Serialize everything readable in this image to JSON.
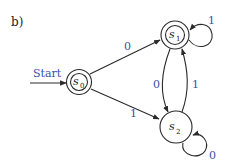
{
  "panel_label": "b)",
  "start_label": "Start",
  "colors": {
    "stroke": "#2a2a2a",
    "label_blue": "#3a4fa8",
    "text": "#1a1a1a",
    "background": "#ffffff"
  },
  "states": [
    {
      "id": "s0",
      "name": "s",
      "subscript": "0",
      "accepting": true,
      "initial": true
    },
    {
      "id": "s1",
      "name": "s",
      "subscript": "1",
      "accepting": true,
      "initial": false
    },
    {
      "id": "s2",
      "name": "s",
      "subscript": "2",
      "accepting": false,
      "initial": false
    }
  ],
  "transitions": [
    {
      "from": "s0",
      "to": "s1",
      "label": "0"
    },
    {
      "from": "s0",
      "to": "s2",
      "label": "1"
    },
    {
      "from": "s1",
      "to": "s1",
      "label": "1"
    },
    {
      "from": "s1",
      "to": "s2",
      "label": "0"
    },
    {
      "from": "s2",
      "to": "s1",
      "label": "1"
    },
    {
      "from": "s2",
      "to": "s2",
      "label": "0"
    }
  ]
}
